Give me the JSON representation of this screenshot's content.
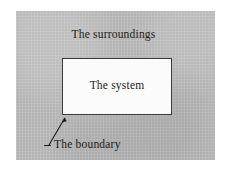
{
  "figure": {
    "name": "thermodynamic-system-diagram",
    "background_color": "#ffffff",
    "surroundings": {
      "label": "The surroundings",
      "fill_color": "#bcbcbc"
    },
    "system": {
      "label": "The system",
      "fill_color": "#fbfbfb",
      "border_color": "#3a3a3a"
    },
    "boundary": {
      "label": "The boundary",
      "line_color": "#1c1c1c",
      "pointer": "arrow-icon"
    }
  }
}
